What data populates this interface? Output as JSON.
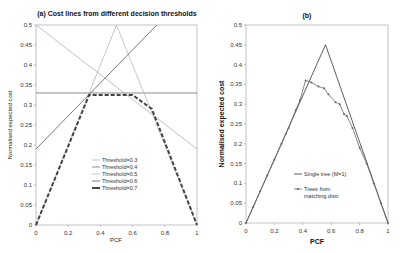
{
  "chart_data": [
    {
      "panel": "a",
      "type": "line",
      "title": "(a) Cost lines from different decision thresholds",
      "xlabel": "PCF",
      "ylabel": "Normalised expected cost",
      "xlim": [
        0,
        1
      ],
      "ylim": [
        0,
        0.5
      ],
      "xticks": [
        "0",
        "0.2",
        "0.4",
        "0.6",
        "0.8",
        "1"
      ],
      "yticks": [
        "0",
        "0.05",
        "0.1",
        "0.15",
        "0.2",
        "0.25",
        "0.3",
        "0.35",
        "0.4",
        "0.45",
        "0.5"
      ],
      "grid": false,
      "legend_position": "center-lower",
      "series": [
        {
          "name": "Threshold=0.3",
          "color": "#b0b0b0",
          "dash": "",
          "points": [
            [
              0,
              0.5
            ],
            [
              1,
              0.19
            ]
          ]
        },
        {
          "name": "Threshold=0.4",
          "color": "#6e6e6e",
          "dash": "",
          "points": [
            [
              0,
              0.33
            ],
            [
              1,
              0.33
            ]
          ]
        },
        {
          "name": "Threshold=0.5",
          "color": "#b8b8b8",
          "dash": "",
          "points": [
            [
              0,
              0
            ],
            [
              0.5,
              0.5
            ],
            [
              1,
              0
            ]
          ]
        },
        {
          "name": "Threshold=0.6",
          "color": "#555555",
          "dash": "",
          "points": [
            [
              0,
              0.19
            ],
            [
              0.75,
              0.5
            ]
          ]
        },
        {
          "name": "Threshold=0.7",
          "color": "#444444",
          "dash": "4,2",
          "width": 2,
          "points": [
            [
              0,
              0
            ],
            [
              0.33,
              0.325
            ],
            [
              0.6,
              0.325
            ],
            [
              0.72,
              0.29
            ],
            [
              1,
              0
            ]
          ]
        }
      ],
      "legend": [
        "Threshold=0.3",
        "Threshold=0.4",
        "Threshold=0.5",
        "Threshold=0.6",
        "Threshold=0.7"
      ]
    },
    {
      "panel": "b",
      "type": "line",
      "title": "(b)",
      "xlabel": "PCF",
      "ylabel": "Normalised expected cost",
      "xlim": [
        0,
        1
      ],
      "ylim": [
        0,
        0.5
      ],
      "xticks": [
        "0",
        "0.2",
        "0.4",
        "0.6",
        "0.8",
        "1"
      ],
      "yticks": [
        "0",
        "0.05",
        "0.1",
        "0.15",
        "0.2",
        "0.25",
        "0.3",
        "0.35",
        "0.4",
        "0.45",
        "0.5"
      ],
      "grid": false,
      "legend_position": "center-lower",
      "series": [
        {
          "name": "Single tree (M=1)",
          "color": "#333333",
          "marker": "none",
          "points": [
            [
              0,
              0
            ],
            [
              0.56,
              0.45
            ],
            [
              1,
              0
            ]
          ]
        },
        {
          "name": "Trees from matching distr.",
          "color": "#666666",
          "marker": "dot",
          "points": [
            [
              0,
              0
            ],
            [
              0.05,
              0.04
            ],
            [
              0.1,
              0.08
            ],
            [
              0.15,
              0.12
            ],
            [
              0.2,
              0.16
            ],
            [
              0.25,
              0.2
            ],
            [
              0.28,
              0.225
            ],
            [
              0.3,
              0.24
            ],
            [
              0.35,
              0.285
            ],
            [
              0.38,
              0.31
            ],
            [
              0.42,
              0.36
            ],
            [
              0.46,
              0.355
            ],
            [
              0.51,
              0.345
            ],
            [
              0.55,
              0.34
            ],
            [
              0.58,
              0.325
            ],
            [
              0.63,
              0.305
            ],
            [
              0.66,
              0.3
            ],
            [
              0.69,
              0.275
            ],
            [
              0.71,
              0.27
            ],
            [
              0.75,
              0.24
            ],
            [
              0.8,
              0.19
            ],
            [
              0.85,
              0.15
            ],
            [
              0.9,
              0.1
            ],
            [
              0.95,
              0.05
            ],
            [
              1,
              0
            ]
          ]
        }
      ],
      "legend": [
        "Single tree (M=1)",
        "Trees from",
        "matching distr."
      ]
    }
  ]
}
